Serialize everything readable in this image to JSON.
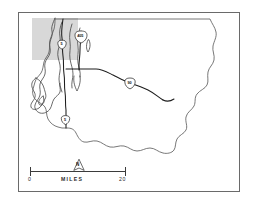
{
  "figure": {
    "name": "king-county-reference-map",
    "background_color": "#ffffff",
    "frame_color": "#6a6a6a"
  },
  "study_area": {
    "label": "study-area-highlight",
    "fill_color": "#d8d8d8"
  },
  "highway_shields": [
    {
      "id": "i-5-north",
      "route": "5",
      "x": 62.0,
      "y": 44.5
    },
    {
      "id": "i-405",
      "route": "405",
      "x": 81.0,
      "y": 36.0
    },
    {
      "id": "i-90",
      "route": "90",
      "x": 130.0,
      "y": 82.5
    },
    {
      "id": "i-5-south",
      "route": "5",
      "x": 65.5,
      "y": 120.0
    }
  ],
  "scale_bar": {
    "min_label": "0",
    "max_label": "20",
    "units_label": "MILES",
    "north_label": "N"
  },
  "geography": {
    "county_boundary": "king-county-outline",
    "water_body": "puget-sound-shoreline",
    "interstate_lines": [
      "i-5",
      "i-405",
      "i-90"
    ]
  }
}
